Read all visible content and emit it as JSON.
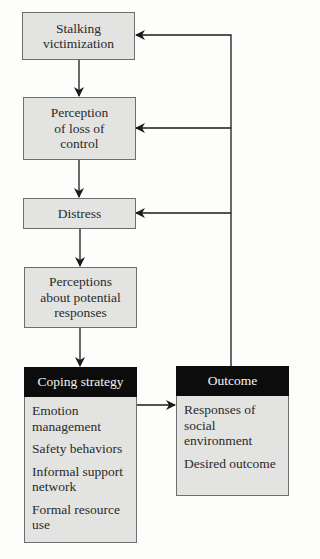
{
  "diagram": {
    "nodes": [
      {
        "id": "stalking",
        "lines": [
          "Stalking",
          "victimization"
        ]
      },
      {
        "id": "loss_of_control",
        "lines": [
          "Perception",
          "of loss of",
          "control"
        ]
      },
      {
        "id": "distress",
        "lines": [
          "Distress"
        ]
      },
      {
        "id": "perceptions",
        "lines": [
          "Perceptions",
          "about potential",
          "responses"
        ]
      }
    ],
    "coping": {
      "title": "Coping strategy",
      "items": [
        "Emotion management",
        "Safety behaviors",
        "Informal support network",
        "Formal resource use"
      ]
    },
    "outcome": {
      "title": "Outcome",
      "items": [
        "Responses of social environment",
        "Desired outcome"
      ]
    },
    "edges": [
      {
        "from": "Stalking victimization",
        "to": "Perception of loss of control"
      },
      {
        "from": "Perception of loss of control",
        "to": "Distress"
      },
      {
        "from": "Distress",
        "to": "Perceptions about potential responses"
      },
      {
        "from": "Perceptions about potential responses",
        "to": "Coping strategy"
      },
      {
        "from": "Coping strategy",
        "to": "Outcome"
      },
      {
        "from": "Outcome",
        "to": "Stalking victimization"
      },
      {
        "from": "Outcome",
        "to": "Perception of loss of control"
      },
      {
        "from": "Outcome",
        "to": "Distress"
      }
    ],
    "colors": {
      "box_fill": "#e3e3e1",
      "box_border": "#6e6e6e",
      "header_fill": "#0c0c0c",
      "header_text": "#f4f4f4",
      "line": "#1a1a1a"
    }
  }
}
